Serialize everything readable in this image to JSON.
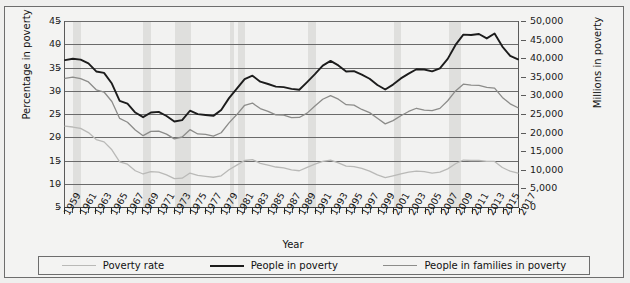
{
  "chart_data": {
    "type": "line",
    "title": "",
    "xlabel": "Year",
    "ylabel": "Percentage in poverty",
    "ylabel_right": "Millions in poverty",
    "xlim": [
      1959,
      2017
    ],
    "ylim": [
      5,
      45
    ],
    "ylim_right": [
      0,
      50000
    ],
    "grid": true,
    "legend_position": "bottom",
    "y_ticks_left": [
      "5",
      "10",
      "15",
      "20",
      "25",
      "30",
      "35",
      "40",
      "45"
    ],
    "y_ticks_right": [
      "0",
      "5,000",
      "10,000",
      "15,000",
      "20,000",
      "25,000",
      "30,000",
      "35,000",
      "40,000",
      "45,000",
      "50,000"
    ],
    "x_tick_labels": [
      "1959",
      "1961",
      "1963",
      "1965",
      "1967",
      "1969",
      "1971",
      "1973",
      "1975",
      "1977",
      "1979",
      "1981",
      "1983",
      "1985",
      "1987",
      "1989",
      "1991",
      "1993",
      "1995",
      "1997",
      "1999",
      "2001",
      "2003",
      "2005",
      "2007",
      "2009",
      "2011",
      "2013",
      "2015",
      "2017"
    ],
    "x": [
      1959,
      1960,
      1961,
      1962,
      1963,
      1964,
      1965,
      1966,
      1967,
      1968,
      1969,
      1970,
      1971,
      1972,
      1973,
      1974,
      1975,
      1976,
      1977,
      1978,
      1979,
      1980,
      1981,
      1982,
      1983,
      1984,
      1985,
      1986,
      1987,
      1988,
      1989,
      1990,
      1991,
      1992,
      1993,
      1994,
      1995,
      1996,
      1997,
      1998,
      1999,
      2000,
      2001,
      2002,
      2003,
      2004,
      2005,
      2006,
      2007,
      2008,
      2009,
      2010,
      2011,
      2012,
      2013,
      2014,
      2015,
      2016,
      2017
    ],
    "recession_bands": [
      {
        "start": 1960,
        "end": 1961
      },
      {
        "start": 1969,
        "end": 1970
      },
      {
        "start": 1973,
        "end": 1975
      },
      {
        "start": 1980,
        "end": 1980.6
      },
      {
        "start": 1981,
        "end": 1982
      },
      {
        "start": 1990,
        "end": 1991
      },
      {
        "start": 2001,
        "end": 2001.8
      },
      {
        "start": 2007.9,
        "end": 2009.5
      }
    ],
    "series": [
      {
        "name": "Poverty rate",
        "color": "#b9b9b7",
        "axis": "left",
        "unit": "percent",
        "values": [
          22.4,
          22.2,
          21.9,
          21.0,
          19.5,
          19.0,
          17.3,
          14.7,
          14.2,
          12.8,
          12.1,
          12.6,
          12.5,
          11.9,
          11.1,
          11.2,
          12.3,
          11.8,
          11.6,
          11.4,
          11.7,
          13.0,
          14.0,
          15.0,
          15.2,
          14.4,
          14.0,
          13.6,
          13.4,
          13.0,
          12.8,
          13.5,
          14.2,
          14.8,
          15.1,
          14.5,
          13.8,
          13.7,
          13.3,
          12.7,
          11.9,
          11.3,
          11.7,
          12.1,
          12.5,
          12.7,
          12.6,
          12.3,
          12.5,
          13.2,
          14.3,
          15.1,
          15.0,
          15.0,
          14.8,
          14.8,
          13.5,
          12.7,
          12.3
        ]
      },
      {
        "name": "People in families in poverty",
        "color": "#8c8c8a",
        "axis": "right",
        "unit": "thousands",
        "values": [
          34562,
          34925,
          34509,
          33623,
          31498,
          30912,
          28358,
          23809,
          22771,
          20695,
          19175,
          20330,
          20405,
          19577,
          18299,
          18817,
          20789,
          19632,
          19505,
          19062,
          19964,
          22601,
          24850,
          27349,
          27933,
          26458,
          25729,
          24754,
          24725,
          24048,
          24066,
          25232,
          27143,
          28961,
          29927,
          28985,
          27501,
          27376,
          26217,
          25370,
          23830,
          22347,
          23215,
          24534,
          25684,
          26544,
          26068,
          25915,
          26509,
          28564,
          31197,
          33015,
          32751,
          32705,
          32181,
          31967,
          29465,
          27724,
          26669
        ]
      },
      {
        "name": "People in poverty",
        "color": "#1c1c1c",
        "axis": "right",
        "unit": "thousands",
        "values": [
          39490,
          39851,
          39628,
          38625,
          36436,
          36055,
          33185,
          28510,
          27769,
          25389,
          24147,
          25420,
          25559,
          24460,
          22973,
          23370,
          25877,
          24975,
          24720,
          24497,
          26072,
          29272,
          31822,
          34398,
          35303,
          33700,
          33064,
          32370,
          32221,
          31745,
          31528,
          33585,
          35708,
          38014,
          39265,
          38059,
          36425,
          36529,
          35574,
          34476,
          32791,
          31581,
          32907,
          34570,
          35861,
          37040,
          36950,
          36460,
          37276,
          39829,
          43569,
          46343,
          46247,
          46496,
          45318,
          46657,
          43123,
          40616,
          39698
        ]
      }
    ]
  },
  "legend": {
    "items": [
      {
        "label": "Poverty rate",
        "color": "#b9b9b7"
      },
      {
        "label": "People in poverty",
        "color": "#1c1c1c"
      },
      {
        "label": "People in families in poverty",
        "color": "#8c8c8a"
      }
    ]
  }
}
